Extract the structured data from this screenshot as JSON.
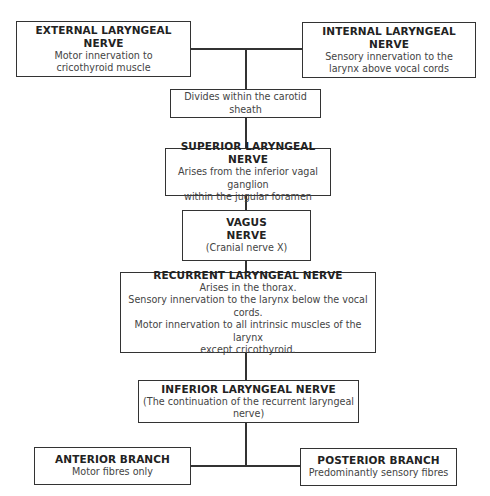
{
  "diagram": {
    "nodes": {
      "external": {
        "title": "EXTERNAL LARYNGEAL NERVE",
        "lines": [
          "Motor innervation to",
          "cricothyroid muscle"
        ]
      },
      "internal": {
        "title": "INTERNAL LARYNGEAL NERVE",
        "lines": [
          "Sensory innervation to the",
          "larynx above vocal cords"
        ]
      },
      "divides": {
        "lines": [
          "Divides within the carotid sheath"
        ]
      },
      "superior": {
        "title": "SUPERIOR LARYNGEAL NERVE",
        "lines": [
          "Arises from the inferior vagal ganglion",
          "within the jugular foramen"
        ]
      },
      "vagus": {
        "title_lines": [
          "VAGUS",
          "NERVE"
        ],
        "lines": [
          "(Cranial nerve X)"
        ]
      },
      "recurrent": {
        "title": "RECURRENT LARYNGEAL NERVE",
        "lines": [
          "Arises in the thorax.",
          "Sensory innervation to the larynx below the vocal cords.",
          "Motor innervation to all intrinsic muscles of the larynx",
          "except cricothyroid."
        ]
      },
      "inferior": {
        "title": "INFERIOR LARYNGEAL NERVE",
        "lines": [
          "(The continuation of the recurrent laryngeal nerve)"
        ]
      },
      "anterior": {
        "title": "ANTERIOR BRANCH",
        "lines": [
          "Motor fibres only"
        ]
      },
      "posterior": {
        "title": "POSTERIOR BRANCH",
        "lines": [
          "Predominantly sensory fibres"
        ]
      }
    },
    "edges": [
      [
        "external",
        "divides"
      ],
      [
        "internal",
        "divides"
      ],
      [
        "divides",
        "superior"
      ],
      [
        "superior",
        "vagus"
      ],
      [
        "vagus",
        "recurrent"
      ],
      [
        "recurrent",
        "inferior"
      ],
      [
        "inferior",
        "anterior"
      ],
      [
        "inferior",
        "posterior"
      ]
    ]
  }
}
